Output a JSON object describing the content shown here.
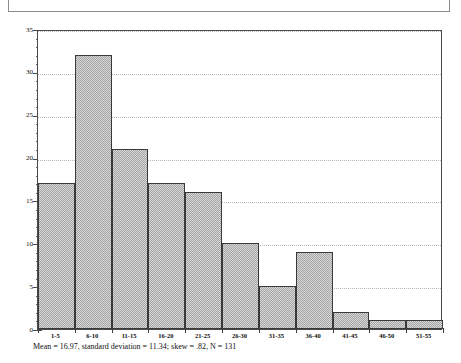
{
  "figure": {
    "caption": "Mean = 16.97, standard deviation = 11.34; skew = .82, N = 131",
    "frame_color": "#4a4a4a",
    "bar_fill_color": "#a6a6a6",
    "bar_edge_color": "#3a3a3a",
    "gridline_color": "#b9b9b9"
  },
  "chart_data": {
    "type": "bar",
    "title": "",
    "subtitle": "",
    "xlabel": "",
    "ylabel": "",
    "categories": [
      "1-5",
      "6-10",
      "11-15",
      "16-20",
      "21-25",
      "26-30",
      "31-35",
      "36-40",
      "41-45",
      "46-50",
      "51-55"
    ],
    "values": [
      17,
      32,
      21,
      17,
      16,
      10,
      5,
      9,
      2,
      1,
      1
    ],
    "ylim": [
      0,
      35
    ],
    "yticks": [
      0,
      5,
      10,
      15,
      20,
      25,
      30,
      35
    ],
    "ytick_labels": [
      "0",
      "5",
      "10",
      "15",
      "20",
      "25",
      "30",
      "35"
    ],
    "y_minor_step": 1,
    "grid": true,
    "grid_axis": "y",
    "legend": "none",
    "annotations": [
      "Mean = 16.97, standard deviation = 11.34; skew = .82, N = 131"
    ]
  }
}
